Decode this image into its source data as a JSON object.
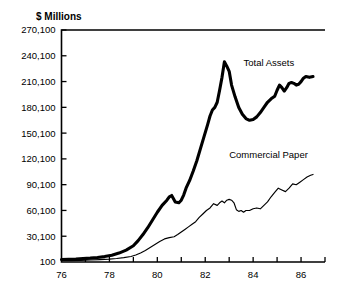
{
  "chart_data": {
    "type": "line",
    "title": "",
    "ylabel": "$ Millions",
    "xlabel": "",
    "grid": false,
    "legend_position": "inline-annotations",
    "xlim": [
      76,
      87
    ],
    "ylim": [
      100,
      270100
    ],
    "x_ticks": [
      76,
      77,
      78,
      79,
      80,
      81,
      82,
      83,
      84,
      85,
      86,
      87
    ],
    "x_tick_labels": [
      "76",
      "",
      "78",
      "",
      "80",
      "",
      "82",
      "",
      "84",
      "",
      "86",
      ""
    ],
    "y_ticks": [
      100,
      30100,
      60100,
      90100,
      120100,
      150100,
      180100,
      210100,
      240100,
      270100
    ],
    "y_tick_labels": [
      "100",
      "30,100",
      "60,100",
      "90,100",
      "120,100",
      "150,100",
      "180,100",
      "210,100",
      "240,100",
      "270,100"
    ],
    "series": [
      {
        "name": "Total Assets",
        "style": "thick",
        "color": "#000000",
        "label_x": 83.6,
        "label_y": 228000,
        "x": [
          76.0,
          76.3,
          76.6,
          76.9,
          77.2,
          77.5,
          77.8,
          78.1,
          78.4,
          78.7,
          79.0,
          79.2,
          79.4,
          79.6,
          79.8,
          80.0,
          80.2,
          80.4,
          80.5,
          80.6,
          80.75,
          80.9,
          81.0,
          81.1,
          81.2,
          81.35,
          81.5,
          81.65,
          81.8,
          81.95,
          82.1,
          82.2,
          82.3,
          82.4,
          82.5,
          82.6,
          82.7,
          82.8,
          82.9,
          83.0,
          83.1,
          83.25,
          83.4,
          83.55,
          83.7,
          83.85,
          84.0,
          84.15,
          84.3,
          84.45,
          84.6,
          84.75,
          84.9,
          85.0,
          85.1,
          85.2,
          85.3,
          85.4,
          85.5,
          85.6,
          85.7,
          85.8,
          85.9,
          86.0,
          86.1,
          86.2,
          86.35,
          86.5
        ],
        "y": [
          3000,
          3200,
          3500,
          4000,
          4600,
          5400,
          6400,
          8000,
          10500,
          14000,
          19000,
          25000,
          32000,
          40000,
          49000,
          58000,
          66000,
          72000,
          76000,
          77500,
          70000,
          69000,
          72000,
          78000,
          86000,
          95000,
          106000,
          118000,
          132000,
          146000,
          160000,
          170000,
          177000,
          180000,
          186000,
          200000,
          215000,
          233000,
          228000,
          222000,
          206000,
          192000,
          180000,
          172000,
          167000,
          165000,
          166000,
          169000,
          174000,
          180000,
          186000,
          190000,
          193000,
          200000,
          206000,
          203000,
          199000,
          203000,
          208000,
          209000,
          208000,
          206000,
          207000,
          210000,
          214000,
          216000,
          215000,
          216000
        ]
      },
      {
        "name": "Commercial Paper",
        "style": "thin",
        "color": "#000000",
        "label_x": 83.0,
        "label_y": 121000,
        "x": [
          76.0,
          76.4,
          76.8,
          77.2,
          77.6,
          78.0,
          78.3,
          78.6,
          78.9,
          79.1,
          79.3,
          79.5,
          79.7,
          79.9,
          80.1,
          80.3,
          80.5,
          80.7,
          80.85,
          81.0,
          81.15,
          81.3,
          81.45,
          81.6,
          81.75,
          81.9,
          82.05,
          82.2,
          82.35,
          82.5,
          82.6,
          82.7,
          82.8,
          82.9,
          83.0,
          83.1,
          83.2,
          83.3,
          83.4,
          83.5,
          83.6,
          83.7,
          83.85,
          84.0,
          84.15,
          84.3,
          84.45,
          84.6,
          84.75,
          84.9,
          85.05,
          85.2,
          85.35,
          85.5,
          85.65,
          85.8,
          85.95,
          86.1,
          86.25,
          86.4,
          86.5
        ],
        "y": [
          1500,
          1700,
          2000,
          2400,
          2900,
          3500,
          4200,
          5200,
          6500,
          8200,
          10500,
          13500,
          17000,
          20500,
          24000,
          27000,
          28500,
          29500,
          32000,
          35000,
          38000,
          41000,
          44000,
          47000,
          52000,
          56000,
          60000,
          63000,
          68000,
          66000,
          69000,
          71000,
          69000,
          72000,
          73000,
          72000,
          69000,
          61000,
          59000,
          60000,
          58000,
          60000,
          60000,
          62000,
          63000,
          62000,
          66000,
          70000,
          76000,
          81000,
          86000,
          84000,
          82000,
          86000,
          91000,
          90000,
          93000,
          96000,
          99000,
          101000,
          102000
        ]
      }
    ]
  }
}
